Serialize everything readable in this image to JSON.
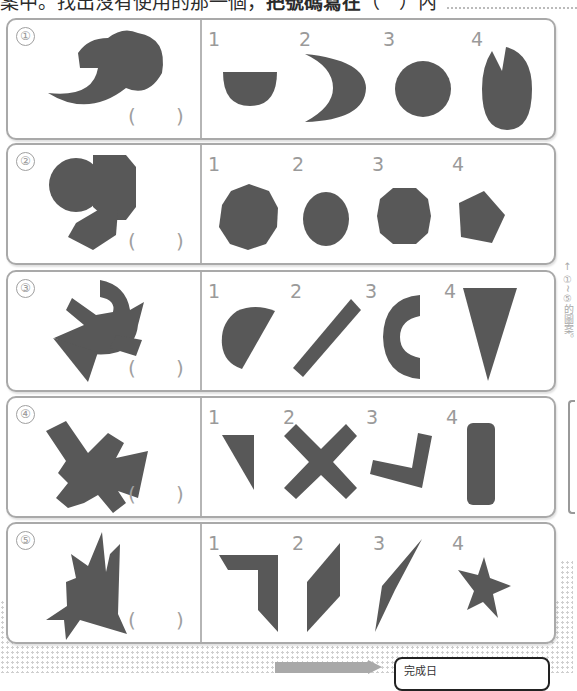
{
  "header": {
    "instruction_prefix": "案中。找出沒有使用的那一個，",
    "instruction_bold": "把號碼寫在",
    "instruction_suffix": "（　）內"
  },
  "side_note": {
    "arrow": "←",
    "text": "①~⑤的圖案。"
  },
  "rows": [
    {
      "number": "①",
      "answer_open": "(",
      "answer_close": ")",
      "options": [
        {
          "label": "1",
          "shape": "half-disc"
        },
        {
          "label": "2",
          "shape": "crescent"
        },
        {
          "label": "3",
          "shape": "circle"
        },
        {
          "label": "4",
          "shape": "ellipse-with-notch"
        }
      ]
    },
    {
      "number": "②",
      "answer_open": "(",
      "answer_close": ")",
      "options": [
        {
          "label": "1",
          "shape": "nonagon"
        },
        {
          "label": "2",
          "shape": "ellipse"
        },
        {
          "label": "3",
          "shape": "octagon"
        },
        {
          "label": "4",
          "shape": "pentagon"
        }
      ]
    },
    {
      "number": "③",
      "answer_open": "(",
      "answer_close": ")",
      "options": [
        {
          "label": "1",
          "shape": "semicircle"
        },
        {
          "label": "2",
          "shape": "diagonal-bar"
        },
        {
          "label": "3",
          "shape": "c-arc"
        },
        {
          "label": "4",
          "shape": "inverted-triangle"
        }
      ]
    },
    {
      "number": "④",
      "answer_open": "(",
      "answer_close": ")",
      "options": [
        {
          "label": "1",
          "shape": "right-triangle"
        },
        {
          "label": "2",
          "shape": "x-cross"
        },
        {
          "label": "3",
          "shape": "l-bracket"
        },
        {
          "label": "4",
          "shape": "rounded-rectangle"
        }
      ]
    },
    {
      "number": "⑤",
      "answer_open": "(",
      "answer_close": ")",
      "options": [
        {
          "label": "1",
          "shape": "angle-bracket"
        },
        {
          "label": "2",
          "shape": "parallelogram"
        },
        {
          "label": "3",
          "shape": "thin-quadrilateral"
        },
        {
          "label": "4",
          "shape": "star"
        }
      ]
    }
  ],
  "footer": {
    "completion_label": "完成日"
  },
  "colors": {
    "shape_fill": "#585858",
    "border": "#a9a9a9",
    "label_gray": "#9a9a9a"
  }
}
